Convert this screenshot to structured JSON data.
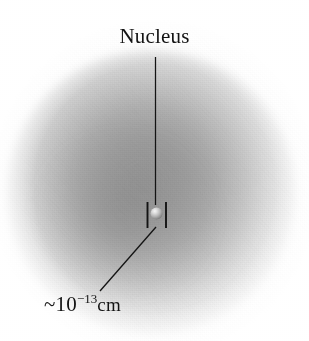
{
  "figure": {
    "width": 309,
    "height": 341,
    "background_color": "#ffffff"
  },
  "labels": {
    "nucleus": "Nucleus",
    "scale_prefix": "~10",
    "scale_exponent": "−13",
    "scale_unit": "cm",
    "scale_full": "~10−13cm"
  },
  "elements": {
    "electron_cloud_name": "electron-cloud",
    "nucleus_name": "nucleus-sphere",
    "leader_top_name": "nucleus-leader-line",
    "leader_bottom_name": "scale-leader-line",
    "caliper_left_name": "scale-tick-left",
    "caliper_right_name": "scale-tick-right"
  },
  "colors": {
    "background": "#ffffff",
    "ink": "#141414",
    "cloud_dark": "#8a8a8a",
    "cloud_mid": "#a8a8a8",
    "cloud_light": "#e6e6e6",
    "nucleus_highlight": "#f2f2f2",
    "nucleus_shadow": "#6e6e6e"
  },
  "geometry": {
    "cloud_center_x": 150,
    "cloud_center_y": 192,
    "cloud_radius": 143,
    "nucleus_x": 155,
    "nucleus_y": 213,
    "nucleus_radius": 5.5,
    "leader_top_from_y": 57,
    "leader_top_to_y": 205,
    "leader_bottom_from": [
      155,
      228
    ],
    "leader_bottom_to": [
      100,
      290
    ],
    "tick_left_x": 147,
    "tick_right_x": 166,
    "tick_top_y": 202,
    "tick_bottom_y": 228
  }
}
